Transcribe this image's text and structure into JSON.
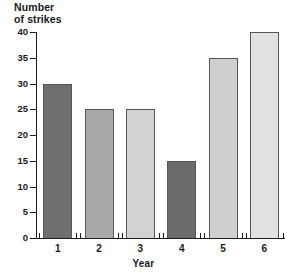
{
  "chart_data": {
    "type": "bar",
    "title": "Number of strikes",
    "title_lines": [
      "Number",
      "of strikes"
    ],
    "xlabel": "Year",
    "ylabel": "Number of strikes",
    "categories": [
      "1",
      "2",
      "3",
      "4",
      "5",
      "6"
    ],
    "values": [
      30,
      25,
      25,
      15,
      35,
      40
    ],
    "bar_colors": [
      "#6f6f6f",
      "#a9a9a9",
      "#d2d2d2",
      "#6b6b6b",
      "#cfcfcf",
      "#e2e2e2"
    ],
    "bar_border_color": "#565656",
    "ylim": [
      0,
      40
    ],
    "yticks": [
      0,
      5,
      10,
      15,
      20,
      25,
      30,
      35,
      40
    ],
    "ytick_labels": [
      "0",
      "5",
      "10",
      "15",
      "20",
      "25",
      "30",
      "35",
      "40"
    ],
    "grid": false,
    "legend": null,
    "axis_color": "#1c1c1c",
    "background": "#ffffff"
  }
}
